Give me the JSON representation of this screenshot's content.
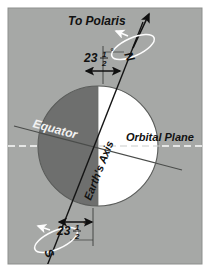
{
  "figure": {
    "panel": {
      "background_color": "#a6a8a6",
      "border_color": "#8d8f8d",
      "page_color": "#ffffff",
      "x": 8,
      "y": 8,
      "width": 194,
      "height": 256
    }
  },
  "globe": {
    "center_x": 98,
    "center_y": 146,
    "radius": 60,
    "night_side_color": "#6e6f6e",
    "day_side_color": "#ffffff",
    "outline_color": "#5a5c5a",
    "night_side_label": "night hemisphere",
    "day_side_label": "day hemisphere"
  },
  "axis": {
    "label": "Earth's Axis",
    "tilt_degrees": 23.5,
    "color": "#141414",
    "north_end_x": 146,
    "north_end_y": 18,
    "south_end_x": 50,
    "south_end_y": 262
  },
  "polaris": {
    "label": "To Polaris",
    "arrow_color": "#101010"
  },
  "poles": {
    "north": {
      "label": "N",
      "rotation_ring_color": "#fdfdfd",
      "rotation_arrow_color": "#fdfdfd"
    },
    "south": {
      "label": "S",
      "rotation_ring_color": "#fdfdfd",
      "rotation_arrow_color": "#fdfdfd"
    }
  },
  "angles": {
    "north": {
      "whole": "23",
      "numerator": "1",
      "denominator": "2",
      "degree_symbol": "°",
      "full_text": "23 1/2°"
    },
    "south": {
      "whole": "23",
      "numerator": "1",
      "denominator": "2",
      "degree_symbol": "°",
      "full_text": "23 1/2°"
    }
  },
  "equator": {
    "label": "Equator",
    "line_color": "#4a4c4a",
    "label_color": "#f2f2f2"
  },
  "orbital_plane": {
    "label": "Orbital Plane",
    "line_color": "#fbfbfb",
    "label_color": "#111111",
    "line_style": "dashed"
  },
  "reference_lines": {
    "vertical_north_color": "#3a3c3a",
    "vertical_south_color": "#3a3c3a"
  }
}
